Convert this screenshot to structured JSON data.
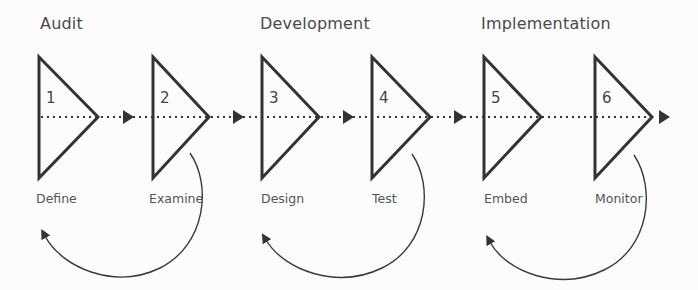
{
  "phases": [
    {
      "title": "Audit",
      "x": 40
    },
    {
      "title": "Development",
      "x": 260
    },
    {
      "title": "Implementation",
      "x": 481
    }
  ],
  "steps": [
    {
      "number": "1",
      "label": "Define",
      "left": 39,
      "tip": 98,
      "label_x": 36
    },
    {
      "number": "2",
      "label": "Examine",
      "left": 153,
      "tip": 209,
      "label_x": 149
    },
    {
      "number": "3",
      "label": "Design",
      "left": 262,
      "tip": 319,
      "label_x": 261
    },
    {
      "number": "4",
      "label": "Test",
      "left": 372,
      "tip": 430,
      "label_x": 372
    },
    {
      "number": "5",
      "label": "Embed",
      "left": 484,
      "tip": 541,
      "label_x": 484
    },
    {
      "number": "6",
      "label": "Monitor",
      "left": 595,
      "tip": 652,
      "label_x": 595
    }
  ],
  "flow_arrows": [
    {
      "from": "1",
      "to": "2",
      "head_x": 123
    },
    {
      "from": "2",
      "to": "3",
      "head_x": 233
    },
    {
      "from": "3",
      "to": "4",
      "head_x": 343
    },
    {
      "from": "4",
      "to": "5",
      "head_x": 454
    },
    {
      "from": "6",
      "to": "end",
      "head_x": 659
    }
  ],
  "feedback_loops": [
    {
      "from": "Examine",
      "to": "Define",
      "phase": "Audit"
    },
    {
      "from": "Test",
      "to": "Design",
      "phase": "Development"
    },
    {
      "from": "Monitor",
      "to": "Embed",
      "phase": "Implementation"
    }
  ],
  "colors": {
    "stroke": "#333333",
    "text": "#4a4a4a",
    "background": "#fcfcfc"
  }
}
